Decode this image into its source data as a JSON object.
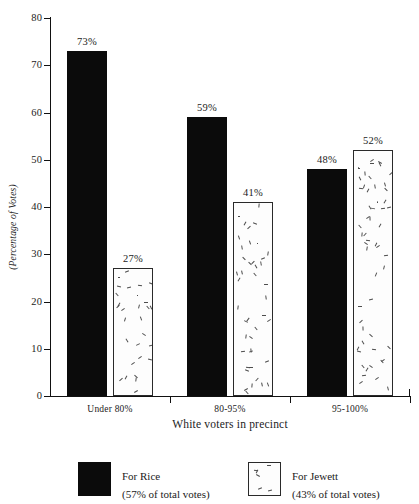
{
  "chart_data": {
    "type": "bar",
    "title": "",
    "subtitle": "",
    "xlabel": "White voters in precinct",
    "ylabel": "(Percentage of Votes)",
    "ylim": [
      0,
      80
    ],
    "yticks": [
      0,
      10,
      20,
      30,
      40,
      50,
      60,
      70,
      80
    ],
    "ytick_labels": [
      "0",
      "10",
      "20",
      "30",
      "40",
      "50",
      "60",
      "70",
      "80"
    ],
    "grid": false,
    "legend_position": "bottom",
    "categories": [
      "Under 80%",
      "80-95%",
      "95-100%"
    ],
    "series": [
      {
        "name": "For Rice",
        "legend_sub": "(57% of total votes)",
        "style": "solid-black",
        "values": [
          73,
          59,
          48
        ],
        "value_labels": [
          "73%",
          "59%",
          "48%"
        ]
      },
      {
        "name": "For Jewett",
        "legend_sub": "(43% of total votes)",
        "style": "speckled-white",
        "values": [
          27,
          41,
          52
        ],
        "value_labels": [
          "27%",
          "41%",
          "52%"
        ]
      }
    ]
  },
  "colors": {
    "series_rice": "#0b0b0b",
    "series_jewett_fill": "#fdfdfd",
    "series_jewett_border": "#2a2a2a",
    "axis": "#111111",
    "text": "#1b1b1b",
    "background": "#ffffff"
  },
  "legend": {
    "entries": [
      {
        "label": "For Rice",
        "sub": "(57% of total votes)"
      },
      {
        "label": "For Jewett",
        "sub": "(43% of total votes)"
      }
    ]
  }
}
